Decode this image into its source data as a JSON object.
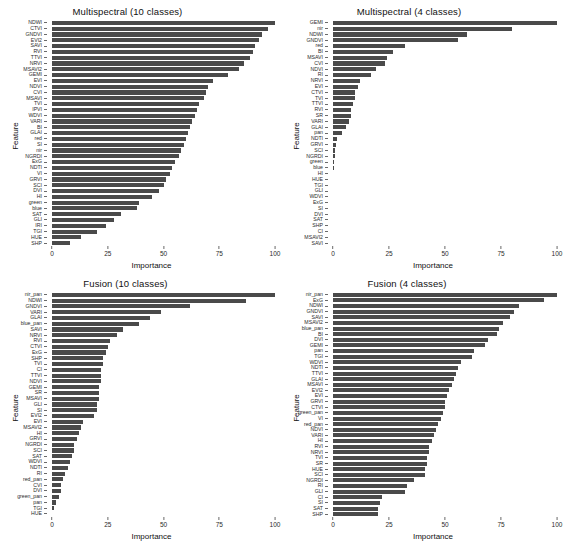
{
  "figure": {
    "width": 563,
    "height": 543,
    "bar_color": "#4a4a4a",
    "background": "#ffffff"
  },
  "chart_data": [
    {
      "type": "bar",
      "orientation": "horizontal",
      "title": "Multispectral (10 classes)",
      "xlabel": "Importance",
      "ylabel": "Feature",
      "xlim": [
        0,
        100
      ],
      "xticks": [
        "0",
        "25",
        "50",
        "75",
        "100"
      ],
      "grid": false,
      "categories": [
        "NDWI",
        "CTVI",
        "GNDVI",
        "EVI2",
        "SAVI",
        "RVI",
        "TTVI",
        "NRVI",
        "MSAVI2",
        "GEMI",
        "EVI",
        "NDVI",
        "CVI",
        "MSAVI",
        "TVI",
        "IPVI",
        "WDVI",
        "VARI",
        "BI",
        "GLAI",
        "red",
        "SI",
        "nir",
        "NGRDI",
        "ExG",
        "NDTI",
        "VI",
        "GRVI",
        "SCI",
        "DVI",
        "HI",
        "green",
        "blue",
        "SAT",
        "GLI",
        "IRI",
        "TGI",
        "HUE",
        "SHP"
      ],
      "values": [
        100,
        97,
        94,
        93,
        91,
        90,
        89,
        86,
        84,
        79,
        72,
        70,
        69,
        68,
        66,
        65,
        64,
        63,
        62,
        61,
        60,
        59,
        58,
        57,
        55,
        54,
        53,
        51,
        50,
        48,
        45,
        39,
        38,
        31,
        28,
        24,
        20,
        13,
        8
      ]
    },
    {
      "type": "bar",
      "orientation": "horizontal",
      "title": "Multispectral (4 classes)",
      "xlabel": "Importance",
      "ylabel": "Feature",
      "xlim": [
        0,
        100
      ],
      "xticks": [
        "0",
        "25",
        "50",
        "75",
        "100"
      ],
      "grid": false,
      "categories": [
        "GEMI",
        "nir",
        "NDWI",
        "GNDVI",
        "red",
        "BI",
        "MSAVI",
        "CVI",
        "NDVI",
        "RI",
        "NRVI",
        "EVI",
        "CTVI",
        "TVI",
        "TTVI",
        "RVI",
        "SR",
        "VARI",
        "GLAI",
        "pan",
        "NDTI",
        "GRVI",
        "SCI",
        "NGRDI",
        "green",
        "blue",
        "HI",
        "HUE",
        "TGI",
        "GLI",
        "WDVI",
        "ExG",
        "SI",
        "DVI",
        "SAT",
        "SHP",
        "CI",
        "MSAVI2",
        "SAVI"
      ],
      "values": [
        100,
        80,
        60,
        56,
        32,
        27,
        24,
        23,
        19,
        17,
        12,
        11,
        10,
        10,
        9,
        8,
        8,
        7,
        6,
        4,
        2,
        1.5,
        1,
        0.8,
        0.6,
        0.5,
        0,
        0,
        0,
        0,
        0,
        0,
        0,
        0,
        0,
        0,
        0,
        0,
        0
      ]
    },
    {
      "type": "bar",
      "orientation": "horizontal",
      "title": "Fusion (10 classes)",
      "xlabel": "Importance",
      "ylabel": "Feature",
      "xlim": [
        0,
        100
      ],
      "xticks": [
        "0",
        "25",
        "50",
        "75",
        "100"
      ],
      "grid": false,
      "categories": [
        "nir_pan",
        "NDWI",
        "GNDVI",
        "VARI",
        "GLAI",
        "blue_pan",
        "SAVI",
        "NRVI",
        "RVI",
        "CTVI",
        "ExG",
        "SHP",
        "TVI",
        "CI",
        "TTVI",
        "NDVI",
        "GEMI",
        "SR",
        "MSAVI",
        "GLI",
        "SI",
        "EVI2",
        "EVI",
        "MSAVI2",
        "HI",
        "GRVI",
        "NGRDI",
        "SCI",
        "SAT",
        "WDVI",
        "NDTI",
        "RI",
        "red_pan",
        "CVI",
        "DVI",
        "green_pan",
        "pan",
        "TGI",
        "HUE"
      ],
      "values": [
        100,
        87,
        62,
        49,
        44,
        39,
        32,
        29,
        26,
        25,
        24,
        23,
        23,
        22,
        22,
        22,
        21,
        21,
        21,
        20,
        20,
        19,
        14,
        13,
        12,
        11,
        10,
        10,
        9,
        8,
        7,
        6,
        5,
        4,
        4,
        3,
        2,
        1,
        0
      ]
    },
    {
      "type": "bar",
      "orientation": "horizontal",
      "title": "Fusion (4 classes)",
      "xlabel": "Importance",
      "ylabel": "Feature",
      "xlim": [
        0,
        100
      ],
      "xticks": [
        "0",
        "25",
        "50",
        "75",
        "100"
      ],
      "grid": false,
      "categories": [
        "nir_pan",
        "ExG",
        "NDWI",
        "GNDVI",
        "SAVI",
        "MSAVI2",
        "blue_pan",
        "BI",
        "DVI",
        "GEMI",
        "pan",
        "TGI",
        "WDVI",
        "NDTI",
        "TTVI",
        "GLAI",
        "MSAVI",
        "EVI2",
        "EVI",
        "GRVI",
        "CTVI",
        "green_pan",
        "VI",
        "red_pan",
        "NDVI",
        "VARI",
        "HI",
        "RVI",
        "NRVI",
        "TVI",
        "SR",
        "HUE",
        "SCI",
        "NGRDI",
        "RI",
        "GLI",
        "CI",
        "SI",
        "SAT",
        "SHP"
      ],
      "values": [
        100,
        94,
        83,
        81,
        79,
        76,
        74,
        73,
        69,
        68,
        63,
        62,
        57,
        56,
        55,
        54,
        53,
        52,
        51,
        50,
        50,
        49,
        48,
        47,
        46,
        45,
        44,
        43,
        43,
        42,
        42,
        41,
        41,
        36,
        33,
        32,
        22,
        21,
        20,
        20
      ]
    }
  ]
}
